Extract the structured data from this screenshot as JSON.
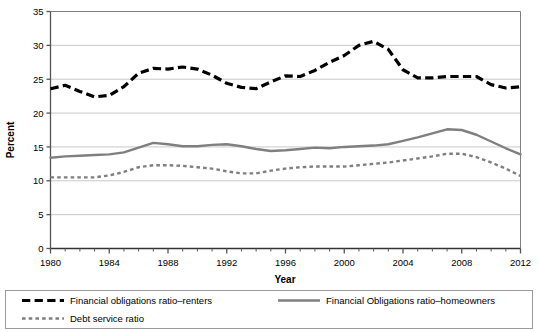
{
  "chart_data": {
    "type": "line",
    "title": "",
    "xlabel": "Year",
    "ylabel": "Percent",
    "xlim": [
      1980,
      2012
    ],
    "ylim": [
      0,
      35
    ],
    "ytick_step": 5,
    "yticks": [
      0,
      5,
      10,
      15,
      20,
      25,
      30,
      35
    ],
    "xticks": [
      1980,
      1984,
      1988,
      1992,
      1996,
      2000,
      2004,
      2008,
      2012
    ],
    "xtick_labels": [
      "1980",
      "1984",
      "1988",
      "1992",
      "1996",
      "2000",
      "2004",
      "2008",
      "2012"
    ],
    "ytick_labels": [
      "0",
      "5",
      "10",
      "15",
      "20",
      "25",
      "30",
      "35"
    ],
    "minor_xtick_interval": 1,
    "grid": "horizontal",
    "grid_color": "#c8c8c8",
    "legend_position": "bottom",
    "x": [
      1980,
      1981,
      1982,
      1983,
      1984,
      1985,
      1986,
      1987,
      1988,
      1989,
      1990,
      1991,
      1992,
      1993,
      1994,
      1995,
      1996,
      1997,
      1998,
      1999,
      2000,
      2001,
      2002,
      2003,
      2004,
      2005,
      2006,
      2007,
      2008,
      2009,
      2010,
      2011,
      2012
    ],
    "series": [
      {
        "name": "Financial obligations ratio–renters",
        "color": "#000000",
        "style": "dashed",
        "width": 3.2,
        "values": [
          23.6,
          24.1,
          23.2,
          22.4,
          22.6,
          23.9,
          25.9,
          26.6,
          26.5,
          26.8,
          26.5,
          25.6,
          24.4,
          23.8,
          23.6,
          24.6,
          25.5,
          25.4,
          26.3,
          27.5,
          28.5,
          30.0,
          30.6,
          29.4,
          26.4,
          25.2,
          25.2,
          25.4,
          25.4,
          25.4,
          24.2,
          23.7,
          23.9
        ]
      },
      {
        "name": "Financial Obligations ratio–homeowners",
        "color": "#7f7f7f",
        "style": "solid",
        "width": 2.4,
        "values": [
          13.4,
          13.6,
          13.7,
          13.8,
          13.9,
          14.2,
          14.9,
          15.6,
          15.4,
          15.1,
          15.1,
          15.3,
          15.4,
          15.1,
          14.7,
          14.4,
          14.5,
          14.7,
          14.9,
          14.8,
          15.0,
          15.1,
          15.2,
          15.4,
          15.9,
          16.4,
          17.0,
          17.6,
          17.5,
          16.8,
          15.8,
          14.8,
          13.9
        ]
      },
      {
        "name": "Debt service ratio",
        "color": "#7f7f7f",
        "style": "dotted",
        "width": 2.4,
        "values": [
          10.5,
          10.5,
          10.5,
          10.5,
          10.8,
          11.3,
          12.0,
          12.3,
          12.3,
          12.2,
          12.0,
          11.8,
          11.4,
          11.1,
          11.1,
          11.5,
          11.8,
          12.0,
          12.1,
          12.1,
          12.1,
          12.3,
          12.5,
          12.7,
          13.0,
          13.3,
          13.6,
          14.0,
          14.0,
          13.5,
          12.7,
          11.8,
          10.7
        ]
      }
    ]
  },
  "legend": {
    "entries": [
      {
        "label": "Financial obligations ratio–renters",
        "swatch": "dashed-black"
      },
      {
        "label": "Financial Obligations ratio–homeowners",
        "swatch": "solid-gray"
      },
      {
        "label": "Debt service ratio",
        "swatch": "dotted-gray"
      }
    ]
  }
}
